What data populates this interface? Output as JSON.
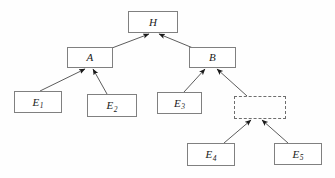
{
  "diagram": {
    "type": "fault-tree",
    "title": "",
    "background_color": "#fefefe",
    "node_border_color": "#808080",
    "edge_color": "#4a4a4a",
    "nodes": [
      {
        "id": "H",
        "label": "H",
        "sub": "",
        "style": "solid",
        "x": 128,
        "y": 11,
        "w": 50,
        "h": 22
      },
      {
        "id": "A",
        "label": "A",
        "sub": "",
        "style": "solid",
        "x": 67,
        "y": 47,
        "w": 46,
        "h": 21
      },
      {
        "id": "B",
        "label": "B",
        "sub": "",
        "style": "solid",
        "x": 189,
        "y": 47,
        "w": 47,
        "h": 21
      },
      {
        "id": "E1",
        "label": "E",
        "sub": "1",
        "style": "solid",
        "x": 14,
        "y": 91,
        "w": 48,
        "h": 22
      },
      {
        "id": "E2",
        "label": "E",
        "sub": "2",
        "style": "solid",
        "x": 87,
        "y": 94,
        "w": 50,
        "h": 23
      },
      {
        "id": "E3",
        "label": "E",
        "sub": "3",
        "style": "solid",
        "x": 157,
        "y": 92,
        "w": 45,
        "h": 22
      },
      {
        "id": "UD",
        "label": "",
        "sub": "",
        "style": "dashed",
        "x": 234,
        "y": 96,
        "w": 52,
        "h": 23
      },
      {
        "id": "E4",
        "label": "E",
        "sub": "4",
        "style": "solid",
        "x": 187,
        "y": 143,
        "w": 48,
        "h": 23
      },
      {
        "id": "E5",
        "label": "E",
        "sub": "5",
        "style": "solid",
        "x": 274,
        "y": 143,
        "w": 48,
        "h": 22
      }
    ],
    "edges": [
      {
        "from": "A",
        "to": "H",
        "x1": 112,
        "y1": 48,
        "x2": 149,
        "y2": 34
      },
      {
        "from": "B",
        "to": "H",
        "x1": 193,
        "y1": 48,
        "x2": 159,
        "y2": 34
      },
      {
        "from": "E1",
        "to": "A",
        "x1": 40,
        "y1": 91,
        "x2": 85,
        "y2": 69
      },
      {
        "from": "E2",
        "to": "A",
        "x1": 107,
        "y1": 94,
        "x2": 93,
        "y2": 69
      },
      {
        "from": "E3",
        "to": "B",
        "x1": 184,
        "y1": 92,
        "x2": 205,
        "y2": 69
      },
      {
        "from": "UD",
        "to": "B",
        "x1": 247,
        "y1": 96,
        "x2": 217,
        "y2": 69
      },
      {
        "from": "E4",
        "to": "UD",
        "x1": 224,
        "y1": 143,
        "x2": 251,
        "y2": 120
      },
      {
        "from": "E5",
        "to": "UD",
        "x1": 288,
        "y1": 143,
        "x2": 262,
        "y2": 120
      }
    ]
  }
}
